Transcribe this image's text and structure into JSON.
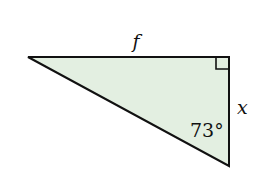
{
  "diagram": {
    "type": "right-triangle",
    "fill_color": "#e3efe1",
    "stroke_color": "#111111",
    "labels": {
      "top_side": "f",
      "right_side": "x",
      "angle": "73°"
    },
    "right_angle_marker": true
  }
}
